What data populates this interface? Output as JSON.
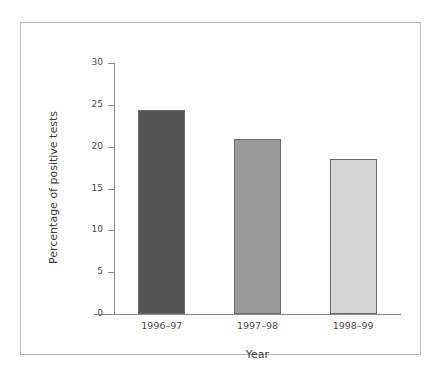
{
  "chart_data": {
    "type": "bar",
    "title": "",
    "subtitle": "",
    "xlabel": "Year",
    "ylabel": "Percentage of positive tests",
    "categories": [
      "1996–97",
      "1997–98",
      "1998–99"
    ],
    "values": [
      24.4,
      20.9,
      18.5
    ],
    "series": [
      {
        "name": "Percentage of positive tests",
        "values": [
          24.4,
          20.9,
          18.5
        ]
      }
    ],
    "ylim": [
      0,
      30
    ],
    "yticks": [
      0,
      5,
      10,
      15,
      20,
      25,
      30
    ],
    "ytick_labels": [
      "0",
      "5",
      "10",
      "15",
      "20",
      "25",
      "30"
    ],
    "grid": false,
    "legend": false,
    "legend_position": "none",
    "bar_colors": [
      "#555555",
      "#9a9a9a",
      "#d5d5d5"
    ],
    "bar_edge_color": "#6a6a6a",
    "axis_color": "#8a8a8a",
    "frame_color": "#b9b9b9",
    "background_color": "#ffffff",
    "text_color": "#3b3b3b"
  }
}
